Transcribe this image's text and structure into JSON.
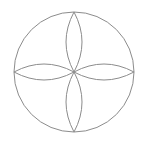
{
  "diagram": {
    "type": "geometric-figure",
    "stroke_color": "#8c8c8c",
    "background": "#ffffff",
    "circle": {
      "cx": 74,
      "cy": 72,
      "r": 60
    },
    "petals": [
      "top",
      "right",
      "bottom",
      "left"
    ]
  }
}
